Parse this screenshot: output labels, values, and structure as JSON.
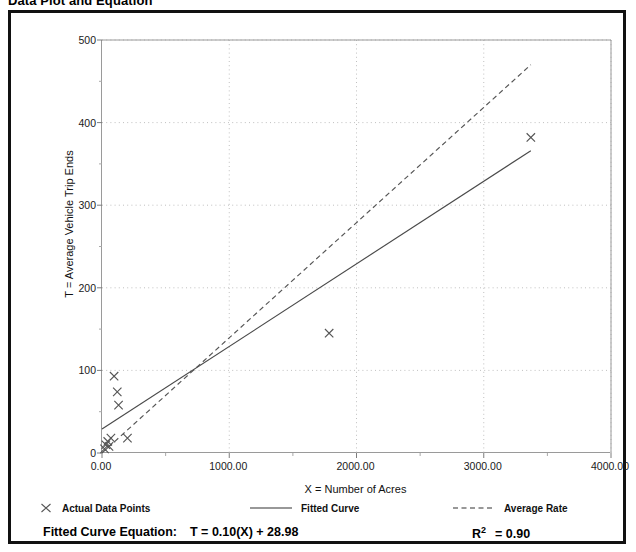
{
  "page": {
    "title": "Data Plot and Equation"
  },
  "chart_data": {
    "type": "scatter",
    "title": "Data Plot and Equation",
    "xlabel": "X = Number of Acres",
    "ylabel": "T = Average Vehicle Trip Ends",
    "xlim": [
      0,
      4000
    ],
    "ylim": [
      0,
      500
    ],
    "xticks": [
      0,
      1000,
      2000,
      3000,
      4000
    ],
    "xtick_labels": [
      "0.00",
      "1000.00",
      "2000.00",
      "3000.00",
      "4000.00"
    ],
    "xminor_step": 500,
    "yticks": [
      0,
      100,
      200,
      300,
      400,
      500
    ],
    "ytick_labels": [
      "0",
      "100",
      "200",
      "300",
      "400",
      "500"
    ],
    "yminor_step": 50,
    "grid": true,
    "grid_style": "dotted",
    "grid_color": "#b9b9b9",
    "legend_position": "below-plot",
    "series": [
      {
        "name": "Actual Data Points",
        "type": "scatter",
        "marker": "x",
        "color": "#555555",
        "points": [
          {
            "x": 20,
            "y": 5
          },
          {
            "x": 30,
            "y": 10
          },
          {
            "x": 45,
            "y": 14
          },
          {
            "x": 55,
            "y": 8
          },
          {
            "x": 70,
            "y": 18
          },
          {
            "x": 95,
            "y": 93
          },
          {
            "x": 120,
            "y": 74
          },
          {
            "x": 130,
            "y": 58
          },
          {
            "x": 200,
            "y": 18
          },
          {
            "x": 1785,
            "y": 145
          },
          {
            "x": 3370,
            "y": 382
          }
        ]
      },
      {
        "name": "Fitted Curve",
        "type": "line",
        "style": "solid",
        "color": "#4a4a4a",
        "equation": "T = 0.10(X) + 28.98",
        "slope": 0.1,
        "intercept": 28.98,
        "endpoints": [
          {
            "x": 0,
            "y": 28.98
          },
          {
            "x": 3370,
            "y": 366
          }
        ]
      },
      {
        "name": "Average Rate",
        "type": "line",
        "style": "dashed",
        "color": "#555555",
        "endpoints": [
          {
            "x": 0,
            "y": 0
          },
          {
            "x": 3370,
            "y": 470
          }
        ]
      }
    ]
  },
  "legend": {
    "items": [
      {
        "label": "Actual Data Points",
        "marker": "x-marker"
      },
      {
        "label": "Fitted Curve",
        "marker": "solid-line"
      },
      {
        "label": "Average Rate",
        "marker": "dashed-line"
      }
    ]
  },
  "footer": {
    "equation_prefix": "Fitted Curve Equation:",
    "equation_value": "T = 0.10(X) + 28.98",
    "r_squared_symbol": "R",
    "r_squared_exponent": "2",
    "r_squared_value": "= 0.90"
  }
}
